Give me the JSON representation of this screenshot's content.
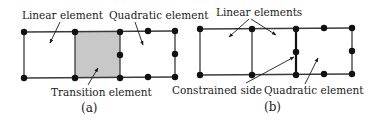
{
  "diagram": {
    "colors": {
      "line": "#3a3a3a",
      "node": "#111111",
      "transition_fill": "#c8c8c8",
      "text": "#1a1a1a"
    },
    "panel_a": {
      "caption": "(a)",
      "labels": {
        "linear": "Linear element",
        "quadratic": "Quadratic element",
        "transition": "Transition element"
      }
    },
    "panel_b": {
      "caption": "(b)",
      "labels": {
        "linear": "Linear elements",
        "constrained": "Constrained side",
        "quadratic": "Quadratic element"
      }
    }
  }
}
